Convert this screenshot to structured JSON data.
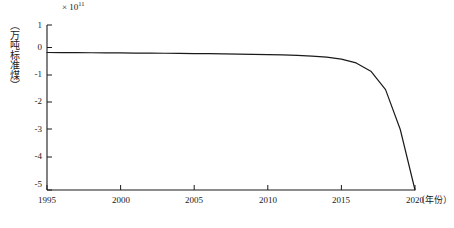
{
  "chart_data": {
    "type": "line",
    "title": "",
    "subtitle": "",
    "xlabel": "（年份）",
    "ylabel": "（万吨标准煤）",
    "exponent_label": "× 10",
    "exponent_power": "11",
    "xlim": [
      1995,
      2020
    ],
    "ylim": [
      -5,
      1
    ],
    "grid": false,
    "legend": null,
    "x_ticks": [
      "1995",
      "2000",
      "2005",
      "2010",
      "2015",
      "2020"
    ],
    "x_tick_values": [
      1995,
      2000,
      2005,
      2010,
      2015,
      2020
    ],
    "y_ticks": [
      "1",
      "0",
      "-1",
      "-2",
      "-3",
      "-4",
      "-5"
    ],
    "y_tick_values": [
      1,
      0,
      -1,
      -2,
      -3,
      -4,
      -5
    ],
    "series": [
      {
        "name": "累计节能量",
        "color": "#1a1a1a",
        "x": [
          1995,
          1996,
          1997,
          1998,
          1999,
          2000,
          2001,
          2002,
          2003,
          2004,
          2005,
          2006,
          2007,
          2008,
          2009,
          2010,
          2011,
          2012,
          2013,
          2014,
          2015,
          2016,
          2017,
          2018,
          2019,
          2020
        ],
        "values": [
          0.0,
          -0.003,
          -0.006,
          -0.009,
          -0.012,
          -0.016,
          -0.02,
          -0.024,
          -0.028,
          -0.033,
          -0.038,
          -0.044,
          -0.05,
          -0.057,
          -0.065,
          -0.075,
          -0.088,
          -0.105,
          -0.13,
          -0.17,
          -0.24,
          -0.38,
          -0.68,
          -1.35,
          -2.8,
          -5.0
        ]
      }
    ]
  },
  "axis_geometry": {
    "left": 47,
    "right": 415,
    "top": 25,
    "bottom": 190
  },
  "caption": {
    "text": ""
  }
}
